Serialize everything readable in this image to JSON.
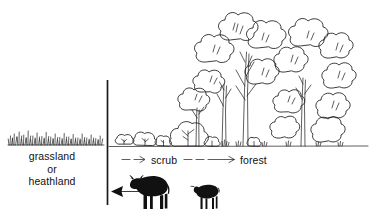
{
  "figure": {
    "kind": "ecological-succession-line-diagram",
    "background_color": "#ffffff",
    "ink_color": "#1a1a1a",
    "width": 370,
    "height": 221
  },
  "zones": {
    "left": {
      "name": "grassland-or-heathland",
      "line1": "grassland",
      "line2": "or",
      "line3": "heathland"
    },
    "middle": {
      "name": "scrub",
      "label": "scrub"
    },
    "right": {
      "name": "forest",
      "label": "forest"
    }
  },
  "succession_arrows": {
    "to_scrub": {
      "style": "single-dash-arrow",
      "direction": "right",
      "glyph": "→"
    },
    "to_forest": {
      "style": "double-dash-arrow",
      "direction": "right",
      "glyph": "→"
    }
  },
  "grazing_arrow": {
    "name": "grazing-pressure-arrow",
    "direction": "left",
    "meaning": "grazing reverses succession"
  },
  "animals": [
    {
      "name": "cow-silhouette",
      "fill": "#111111"
    },
    {
      "name": "sheep-silhouette",
      "fill": "#111111"
    }
  ],
  "divider": {
    "name": "vertical-divider-line",
    "x": 107,
    "y_top": 80,
    "y_bottom": 205
  },
  "ground_line": {
    "name": "ground-line",
    "y": 146,
    "x_start": 108,
    "x_end": 368
  },
  "vegetation": {
    "grass_tuft_count": 26,
    "shrub_count": 7,
    "tree_count": 9
  },
  "colors": {
    "ink": "#1a1a1a",
    "paper": "#ffffff",
    "silhouette": "#111111"
  }
}
